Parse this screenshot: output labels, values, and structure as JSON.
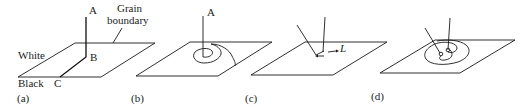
{
  "figure": {
    "panels": [
      {
        "id": "a",
        "label": "(a)",
        "annotations": {
          "A": "A",
          "B": "B",
          "C": "C",
          "white": "White",
          "black": "Black",
          "grain_boundary_line1": "Grain",
          "grain_boundary_line2": "boundary"
        }
      },
      {
        "id": "b",
        "label": "(b)",
        "annotations": {
          "A": "A"
        }
      },
      {
        "id": "c",
        "label": "(c)",
        "annotations": {
          "L": "L"
        }
      },
      {
        "id": "d",
        "label": "(d)",
        "annotations": {}
      }
    ],
    "colors": {
      "line": "#1a1a1a",
      "text": "#222222",
      "background": "#ffffff"
    }
  }
}
